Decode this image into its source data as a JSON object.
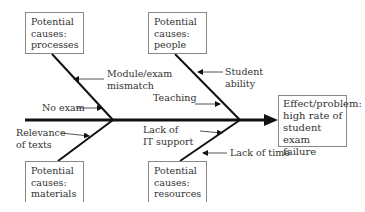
{
  "diagram": {
    "type": "fishbone",
    "effect": {
      "lines": [
        "Effect/problem:",
        "high rate of",
        "student exam",
        "failure"
      ]
    },
    "categories": {
      "processes": {
        "lines": [
          "Potential",
          "causes:",
          "processes"
        ]
      },
      "people": {
        "lines": [
          "Potential",
          "causes:",
          "people"
        ]
      },
      "materials": {
        "lines": [
          "Potential",
          "causes:",
          "materials"
        ]
      },
      "resources": {
        "lines": [
          "Potential",
          "causes:",
          "resources"
        ]
      }
    },
    "causes": {
      "module_exam_mismatch": {
        "lines": [
          "Module/exam",
          "mismatch"
        ]
      },
      "no_exam": {
        "lines": [
          "No exam"
        ]
      },
      "student_ability": {
        "lines": [
          "Student",
          "ability"
        ]
      },
      "teaching": {
        "lines": [
          "Teaching"
        ]
      },
      "relevance_of_texts": {
        "lines": [
          "Relevance",
          "of texts"
        ]
      },
      "lack_of_it_support": {
        "lines": [
          "Lack of",
          "IT support"
        ]
      },
      "lack_of_time": {
        "lines": [
          "Lack of time"
        ]
      }
    }
  }
}
